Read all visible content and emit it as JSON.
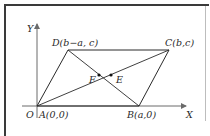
{
  "diagram": {
    "type": "parallelogram-on-coordinate-axes",
    "axes": {
      "x_label": "X",
      "y_label": "Y",
      "origin_label": "O"
    },
    "vertices": [
      {
        "name": "A",
        "label": "A(0,0)"
      },
      {
        "name": "B",
        "label": "B(a,0)"
      },
      {
        "name": "C",
        "label": "C(b,c)"
      },
      {
        "name": "D",
        "label": "D(b−a, c)"
      }
    ],
    "diagonals": [
      "AC",
      "BD"
    ],
    "points": [
      {
        "name": "F",
        "label": "F"
      },
      {
        "name": "E",
        "label": "E"
      }
    ],
    "colors": {
      "line": "#2a2a2a",
      "frame": "#3a3a3a",
      "axis": "#6a6a6a"
    }
  }
}
